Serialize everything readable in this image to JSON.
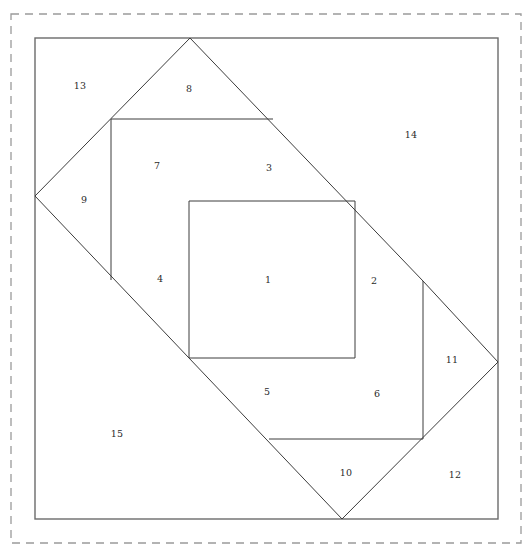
{
  "figure": {
    "canvas": {
      "width": 532,
      "height": 557
    },
    "colors": {
      "background": "#ffffff",
      "line": "#3c3c3c",
      "frame": "#6b6b6b",
      "dashed_frame": "#9a9a9a",
      "label_text": "#2b2b2b"
    },
    "dashed_frame": {
      "x": 11,
      "y": 14,
      "width": 510,
      "height": 529
    },
    "outer_frame": {
      "x": 35,
      "y": 38,
      "width": 463,
      "height": 481
    },
    "labels": [
      {
        "id": "1",
        "text": "1",
        "x": 268,
        "y": 280
      },
      {
        "id": "2",
        "text": "2",
        "x": 374,
        "y": 281
      },
      {
        "id": "3",
        "text": "3",
        "x": 269,
        "y": 168
      },
      {
        "id": "4",
        "text": "4",
        "x": 160,
        "y": 279
      },
      {
        "id": "5",
        "text": "5",
        "x": 267,
        "y": 392
      },
      {
        "id": "6",
        "text": "6",
        "x": 377,
        "y": 394
      },
      {
        "id": "7",
        "text": "7",
        "x": 157,
        "y": 166
      },
      {
        "id": "8",
        "text": "8",
        "x": 189,
        "y": 89
      },
      {
        "id": "9",
        "text": "9",
        "x": 84,
        "y": 200
      },
      {
        "id": "10",
        "text": "10",
        "x": 346,
        "y": 473
      },
      {
        "id": "11",
        "text": "11",
        "x": 452,
        "y": 360
      },
      {
        "id": "12",
        "text": "12",
        "x": 455,
        "y": 475
      },
      {
        "id": "13",
        "text": "13",
        "x": 80,
        "y": 86
      },
      {
        "id": "14",
        "text": "14",
        "x": 411,
        "y": 135
      },
      {
        "id": "15",
        "text": "15",
        "x": 117,
        "y": 434
      }
    ],
    "regions": [
      {
        "id": "1",
        "name": "central-square",
        "points": "189,201 355,201 355,358 189,358"
      },
      {
        "id": "2",
        "name": "right-triangle-inner",
        "points": "355,201 433,280 355,358"
      },
      {
        "id": "3",
        "name": "top-triangle-inner",
        "points": "189,201 270,120 355,201"
      },
      {
        "id": "4",
        "name": "left-triangle-inner",
        "points": "189,201 189,358 113,279"
      },
      {
        "id": "5",
        "name": "bottom-triangle-inner",
        "points": "189,358 355,358 269,439"
      },
      {
        "id": "6",
        "name": "lower-right-triangle",
        "points": "269,439 423,281 423,439"
      },
      {
        "id": "7",
        "name": "upper-left-square",
        "points": "111,119 273,119 273,280 111,280"
      },
      {
        "id": "8",
        "name": "top-apex-triangle",
        "points": "111,119 190,38 270,119"
      },
      {
        "id": "9",
        "name": "left-apex-triangle",
        "points": "111,119 35,196 111,279"
      },
      {
        "id": "10",
        "name": "bottom-apex-triangle",
        "points": "269,439 423,439 342,519"
      },
      {
        "id": "11",
        "name": "right-quad-triangle",
        "points": "423,281 498,362 423,439"
      },
      {
        "id": "12",
        "name": "bottom-right-corner",
        "points": "423,439 498,362 498,519 342,519"
      },
      {
        "13": "",
        "id": "13",
        "name": "top-left-corner",
        "points": "35,38 190,38 111,119 35,196"
      },
      {
        "id": "14",
        "name": "top-right-corner",
        "points": "190,38 498,38 498,362 423,281 270,119"
      },
      {
        "id": "15",
        "name": "bottom-left-corner",
        "points": "35,196 111,279 269,439 342,519 35,519"
      }
    ],
    "strokes": [
      {
        "name": "diamond-upper-left-edge",
        "d": "M 35,196 L 190,38"
      },
      {
        "name": "diamond-upper-right-edge",
        "d": "M 190,38 L 423,281"
      },
      {
        "name": "diamond-lower-left-edge",
        "d": "M 35,196 L 342,519"
      },
      {
        "name": "diamond-lower-right-edge",
        "d": "M 342,519 L 498,362"
      },
      {
        "name": "right-diamond-upper-edge",
        "d": "M 423,281 L 498,362"
      },
      {
        "name": "square7-top-edge",
        "d": "M 111,119 L 273,119"
      },
      {
        "name": "square7-left-edge",
        "d": "M 111,119 L 111,280"
      },
      {
        "name": "central-square-top",
        "d": "M 189,201 L 355,201"
      },
      {
        "name": "central-square-right",
        "d": "M 355,201 L 355,358"
      },
      {
        "name": "central-square-bottom",
        "d": "M 189,358 L 355,358"
      },
      {
        "name": "central-square-left",
        "d": "M 189,201 L 189,358"
      },
      {
        "name": "region11-left-edge",
        "d": "M 423,281 L 423,439"
      },
      {
        "name": "region10-top-edge",
        "d": "M 269,439 L 423,439"
      }
    ]
  }
}
